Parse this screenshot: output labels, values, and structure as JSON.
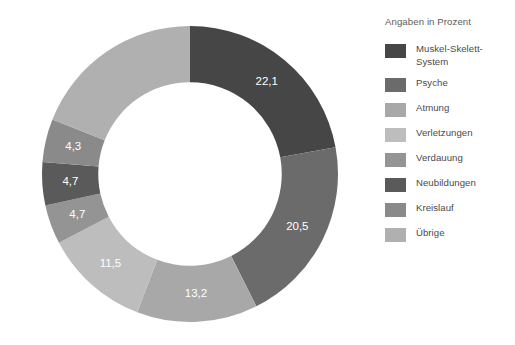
{
  "legend": {
    "title": "Angaben in Prozent",
    "items": [
      {
        "label": "Muskel-Skelett-System",
        "color": "#464646"
      },
      {
        "label": "Psyche",
        "color": "#6b6b6b"
      },
      {
        "label": "Atmung",
        "color": "#a8a8a8"
      },
      {
        "label": "Verletzungen",
        "color": "#bdbdbd"
      },
      {
        "label": "Verdauung",
        "color": "#949494"
      },
      {
        "label": "Neubildungen",
        "color": "#5a5a5a"
      },
      {
        "label": "Kreislauf",
        "color": "#8a8a8a"
      },
      {
        "label": "Übrige",
        "color": "#b0b0b0"
      }
    ]
  },
  "chart_data": {
    "type": "pie",
    "variant": "donut",
    "title": "",
    "subtitle": "",
    "units": "Prozent",
    "legend_position": "right",
    "grid": false,
    "start_angle_deg": 0,
    "direction": "clockwise",
    "inner_radius_ratio": 0.62,
    "categories": [
      "Muskel-Skelett-System",
      "Psyche",
      "Atmung",
      "Verletzungen",
      "Verdauung",
      "Neubildungen",
      "Kreislauf",
      "Übrige"
    ],
    "values": [
      22.1,
      20.5,
      13.2,
      11.5,
      4.3,
      4.7,
      4.7,
      19.0
    ],
    "labels": [
      "22,1",
      "20,5",
      "13,2",
      "11,5",
      "4,3",
      "4,7",
      "4,7",
      ""
    ],
    "colors": [
      "#464646",
      "#6b6b6b",
      "#a8a8a8",
      "#bdbdbd",
      "#949494",
      "#5a5a5a",
      "#8a8a8a",
      "#b0b0b0"
    ],
    "slices": [
      {
        "name": "Muskel-Skelett-System",
        "value": 22.1,
        "label": "22,1",
        "color": "#464646"
      },
      {
        "name": "Psyche",
        "value": 20.5,
        "label": "20,5",
        "color": "#6b6b6b"
      },
      {
        "name": "Atmung",
        "value": 13.2,
        "label": "13,2",
        "color": "#a8a8a8"
      },
      {
        "name": "Verletzungen",
        "value": 11.5,
        "label": "11,5",
        "color": "#bdbdbd"
      },
      {
        "name": "Verdauung",
        "value": 4.3,
        "label": "4,7",
        "color": "#949494"
      },
      {
        "name": "Neubildungen",
        "value": 4.7,
        "label": "4,7",
        "color": "#5a5a5a"
      },
      {
        "name": "Kreislauf",
        "value": 4.7,
        "label": "4,3",
        "color": "#8a8a8a"
      },
      {
        "name": "Übrige",
        "value": 19.0,
        "label": "",
        "color": "#b0b0b0"
      }
    ]
  }
}
